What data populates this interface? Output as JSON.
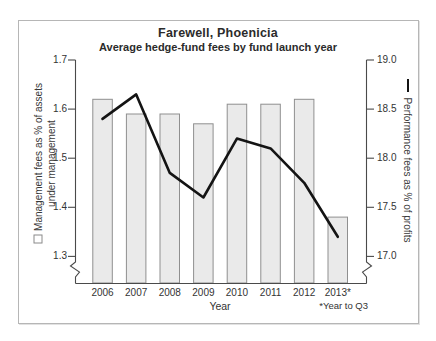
{
  "chart_data": {
    "type": "bar+line combo",
    "title": "Farewell, Phoenicia",
    "subtitle": "Average hedge-fund fees by fund launch year",
    "xlabel": "Year",
    "footnote": "*Year to Q3",
    "categories": [
      "2006",
      "2007",
      "2008",
      "2009",
      "2010",
      "2011",
      "2012",
      "2013*"
    ],
    "series": [
      {
        "name": "Management fees as % of assets under management",
        "type": "bar",
        "axis": "left",
        "values": [
          1.62,
          1.59,
          1.59,
          1.57,
          1.61,
          1.61,
          1.62,
          1.38
        ]
      },
      {
        "name": "Performance fees as % of profits",
        "type": "line",
        "axis": "right",
        "values": [
          18.4,
          18.65,
          17.85,
          17.6,
          18.2,
          18.1,
          17.75,
          17.2
        ]
      }
    ],
    "left_axis": {
      "label_line1": "Management fees as % of assets",
      "label_line2": "under management",
      "ticks": [
        "1.7",
        "1.6",
        "1.5",
        "1.4",
        "1.3"
      ],
      "range": [
        1.3,
        1.7
      ],
      "broken_axis": true
    },
    "right_axis": {
      "label": "Performance fees as % of profits",
      "ticks": [
        "19.0",
        "18.5",
        "18.0",
        "17.5",
        "17.0"
      ],
      "range": [
        17.0,
        19.0
      ],
      "broken_axis": true
    },
    "layout_hints": {
      "grid": "off",
      "legend_position": "rotated-axis-labels"
    },
    "colors": {
      "bar_fill": "#eaeaea",
      "bar_border": "#8f8f8f",
      "line": "#141414",
      "axis": "#4a4a4a",
      "text": "#333333",
      "frame_border": "#b6b6b6"
    }
  }
}
